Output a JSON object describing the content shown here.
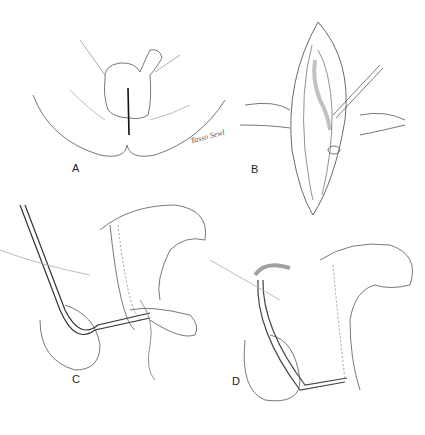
{
  "figure": {
    "panels": [
      {
        "id": "A",
        "label": "A",
        "description": "Perineal view with midline incision"
      },
      {
        "id": "B",
        "label": "B",
        "description": "Opened incision with retractors exposing urethra"
      },
      {
        "id": "C",
        "label": "C",
        "description": "Sagittal section with catheter passed through urethra"
      },
      {
        "id": "D",
        "label": "D",
        "description": "Sagittal section with catheter repositioned"
      }
    ],
    "signature": "Tasso Sewl"
  }
}
